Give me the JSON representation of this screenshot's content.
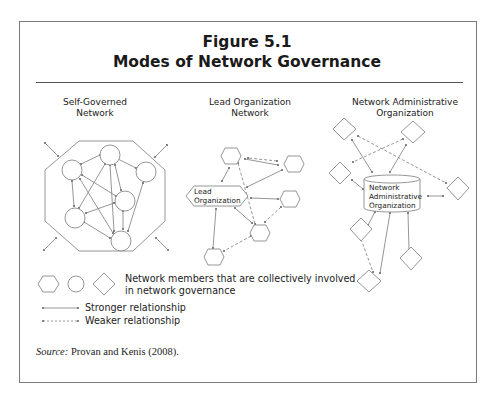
{
  "figure": {
    "number": "Figure 5.1",
    "title": "Modes of Network Governance"
  },
  "columns": [
    {
      "heading_line1": "Self-Governed",
      "heading_line2": "Network",
      "node_shape": "circle"
    },
    {
      "heading_line1": "Lead Organization",
      "heading_line2": "Network",
      "node_shape": "hexagon",
      "central_label_line1": "Lead",
      "central_label_line2": "Organization"
    },
    {
      "heading_line1": "Network Administrative",
      "heading_line2": "Organization",
      "node_shape": "diamond",
      "central_label_line1": "Network",
      "central_label_line2": "Administrative",
      "central_label_line3": "Organization"
    }
  ],
  "legend": {
    "members_line1": "Network members that are collectively involved",
    "members_line2": "in network governance",
    "stronger": "Stronger relationship",
    "weaker": "Weaker relationship"
  },
  "source": {
    "label": "Source:",
    "text": " Provan and Kenis (2008)."
  },
  "colors": {
    "stroke": "#8a8a8a",
    "frame": "#7a7a7a",
    "text": "#1a1a1a"
  }
}
